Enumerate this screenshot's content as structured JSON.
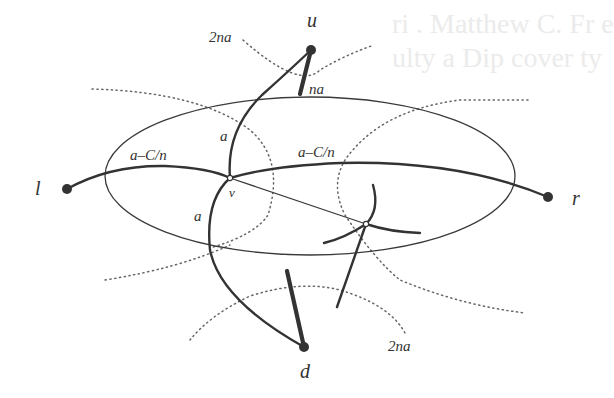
{
  "figure": {
    "type": "graph-diagram",
    "background_color": "#ffffff",
    "ink_color": "#333333",
    "vertices": {
      "u": {
        "label": "u",
        "x": 311,
        "y": 50
      },
      "l": {
        "label": "l",
        "x": 67,
        "y": 189
      },
      "r": {
        "label": "r",
        "x": 548,
        "y": 197
      },
      "d": {
        "label": "d",
        "x": 304,
        "y": 347
      },
      "v": {
        "label": "v",
        "x": 230,
        "y": 178
      }
    },
    "ellipse": {
      "cx": 310,
      "cy": 176,
      "rx": 205,
      "ry": 79
    },
    "edge_labels": {
      "top_left_dotted": "2na",
      "u_bold_edge": "na",
      "upper_a": "a",
      "left_edge": "a–C/n",
      "right_edge": "a–C/n",
      "lower_a": "a",
      "bottom_right_dotted": "2na"
    }
  },
  "background_text": {
    "lines": [
      "ri . Matthew C. Fr e",
      "ulty a Dip cover ty"
    ]
  }
}
